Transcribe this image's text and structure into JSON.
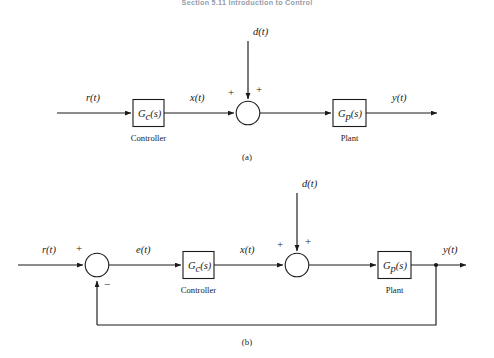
{
  "page": {
    "running_head": "Section 5.11    Introduction to Control",
    "background": "#ffffff",
    "ink": "#1a1a1a"
  },
  "figures": [
    {
      "id": "open-loop",
      "caption": "(a)",
      "signals": {
        "reference": "r(t)",
        "controller_output": "x(t)",
        "disturbance": "d(t)",
        "output": "y(t)"
      },
      "blocks": [
        {
          "transfer": "G",
          "subscript": "c",
          "arg": "(s)",
          "label": "Controller"
        },
        {
          "transfer": "G",
          "subscript": "p",
          "arg": "(s)",
          "label": "Plant"
        }
      ],
      "summers": [
        {
          "signs": [
            "+",
            "+"
          ]
        }
      ]
    },
    {
      "id": "closed-loop",
      "caption": "(b)",
      "signals": {
        "reference": "r(t)",
        "error": "e(t)",
        "controller_output": "x(t)",
        "disturbance": "d(t)",
        "output": "y(t)"
      },
      "blocks": [
        {
          "transfer": "G",
          "subscript": "c",
          "arg": "(s)",
          "label": "Controller"
        },
        {
          "transfer": "G",
          "subscript": "p",
          "arg": "(s)",
          "label": "Plant"
        }
      ],
      "summers": [
        {
          "signs": [
            "+",
            "-"
          ]
        },
        {
          "signs": [
            "+",
            "+"
          ]
        }
      ]
    }
  ],
  "glyphs": {
    "plus": "+",
    "minus": "−"
  }
}
